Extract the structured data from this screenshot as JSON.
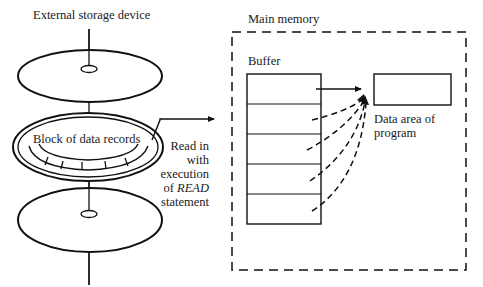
{
  "diagram": {
    "storage": {
      "title": "External storage device",
      "block_label": "Block of data records",
      "record_segments": 6
    },
    "transfer": {
      "line1": "Read in",
      "line2": "with",
      "line3": "execution",
      "line4_prefix": "of ",
      "line4_keyword": "READ",
      "line5": "statement"
    },
    "memory": {
      "title": "Main memory",
      "buffer_label": "Buffer",
      "buffer_rows": 5,
      "data_area_line1": "Data area of",
      "data_area_line2": "program"
    },
    "colors": {
      "ink": "#111111",
      "background": "#ffffff"
    }
  }
}
